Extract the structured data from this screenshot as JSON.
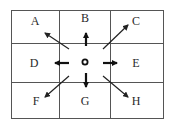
{
  "diagram": {
    "type": "direction-grid",
    "grid": {
      "rows": 3,
      "cols": 3
    },
    "center": {
      "symbol": "circle",
      "label": ""
    },
    "cells": [
      {
        "id": "A",
        "label": "A",
        "position": "top-left",
        "direction": "north-west"
      },
      {
        "id": "B",
        "label": "B",
        "position": "top-center",
        "direction": "north"
      },
      {
        "id": "C",
        "label": "C",
        "position": "top-right",
        "direction": "north-east"
      },
      {
        "id": "D",
        "label": "D",
        "position": "middle-left",
        "direction": "west"
      },
      {
        "id": "E",
        "label": "E",
        "position": "middle-right",
        "direction": "east"
      },
      {
        "id": "F",
        "label": "F",
        "position": "bottom-left",
        "direction": "south-west"
      },
      {
        "id": "G",
        "label": "G",
        "position": "bottom-center",
        "direction": "south"
      },
      {
        "id": "H",
        "label": "H",
        "position": "bottom-right",
        "direction": "south-east"
      }
    ],
    "colors": {
      "line": "#555555",
      "arrow": "#222222",
      "text": "#2a2a2a",
      "background": "#ffffff"
    }
  }
}
